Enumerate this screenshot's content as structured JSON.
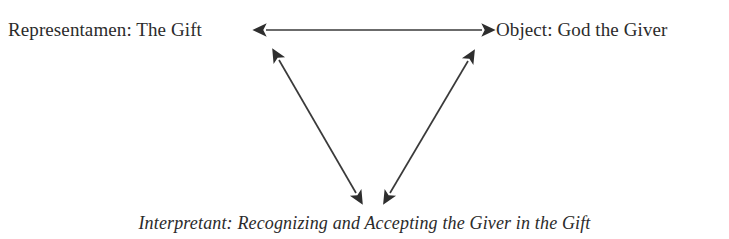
{
  "diagram": {
    "background_color": "#ffffff",
    "text_color": "#2b2b2b",
    "line_color": "#3a3a3a",
    "nodes": [
      {
        "id": "representamen",
        "label": "Representamen: The Gift",
        "role": "Representamen",
        "value": "The Gift",
        "position": "top-left",
        "style": "roman"
      },
      {
        "id": "object",
        "label": "Object: God the Giver",
        "role": "Object",
        "value": "God the Giver",
        "position": "top-right",
        "style": "roman"
      },
      {
        "id": "interpretant",
        "label": "Interpretant: Recognizing and Accepting the Giver in the Gift",
        "role": "Interpretant",
        "value": "Recognizing and Accepting the Giver in the Gift",
        "position": "bottom-center",
        "style": "italic"
      }
    ],
    "connectors": [
      {
        "id": "representamen-object",
        "from": "representamen",
        "to": "object",
        "kind": "double-headed-arrow",
        "orientation": "horizontal"
      },
      {
        "id": "representamen-interpretant",
        "from": "representamen",
        "to": "interpretant",
        "kind": "double-headed-arrow",
        "orientation": "diagonal-left"
      },
      {
        "id": "object-interpretant",
        "from": "object",
        "to": "interpretant",
        "kind": "double-headed-arrow",
        "orientation": "diagonal-right"
      }
    ]
  }
}
